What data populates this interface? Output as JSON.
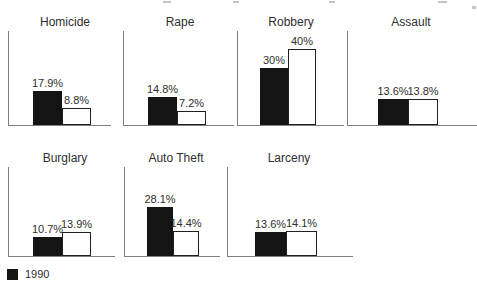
{
  "figure": {
    "legend": {
      "label": "1990",
      "swatch_color": "#141414"
    },
    "colors": {
      "bar_filled": "#141414",
      "bar_outline_border": "#1f1f1f",
      "axis": "#7e7e7e",
      "text": "#2f2f2f"
    }
  },
  "chart_data": {
    "type": "bar",
    "title": "",
    "categories": [
      "Homicide",
      "Rape",
      "Robbery",
      "Assault",
      "Burglary",
      "Auto Theft",
      "Larceny"
    ],
    "series": [
      {
        "name": "1990",
        "style": "filled-black",
        "values": [
          17.9,
          14.8,
          30,
          13.6,
          10.7,
          28.1,
          13.6
        ]
      },
      {
        "name": "",
        "style": "outlined-white",
        "values": [
          8.8,
          7.2,
          40,
          13.8,
          13.9,
          14.4,
          14.1
        ]
      }
    ],
    "value_labels": [
      [
        "17.9%",
        "8.8%"
      ],
      [
        "14.8%",
        "7.2%"
      ],
      [
        "30%",
        "40%"
      ],
      [
        "13.6%",
        "13.8%"
      ],
      [
        "10.7%",
        "13.9%"
      ],
      [
        "28.1%",
        "14.4%"
      ],
      [
        "13.6%",
        "14.1%"
      ]
    ],
    "legend": [
      {
        "label": "1990",
        "swatch": "filled-black"
      }
    ],
    "layout": {
      "unit": "percent",
      "grid": false,
      "legend_position": "bottom-left",
      "rows": [
        {
          "panel_idx": [
            0,
            1,
            2,
            3
          ],
          "title_y": 16,
          "axis_top_y": 31,
          "baseline_y": 125,
          "px_per_percent": 1.9
        },
        {
          "panel_idx": [
            4,
            5,
            6
          ],
          "title_y": 152,
          "axis_top_y": 167,
          "baseline_y": 256,
          "px_per_percent": 1.75
        }
      ],
      "panel_geometry": [
        {
          "axis_x": 8,
          "baseline_w": 103,
          "bar_offset": 25,
          "bar_w": 29
        },
        {
          "axis_x": 123,
          "baseline_w": 111,
          "bar_offset": 25,
          "bar_w": 29
        },
        {
          "axis_x": 237,
          "baseline_w": 107,
          "bar_offset": 23,
          "bar_w": 28
        },
        {
          "axis_x": 347,
          "baseline_w": 130,
          "bar_offset": 31,
          "bar_w": 30
        },
        {
          "axis_x": 8,
          "baseline_w": 107,
          "bar_offset": 25,
          "bar_w": 29
        },
        {
          "axis_x": 124,
          "baseline_w": 96,
          "bar_offset": 23,
          "bar_w": 26
        },
        {
          "axis_x": 227,
          "baseline_w": 126,
          "bar_offset": 28,
          "bar_w": 31
        }
      ]
    }
  }
}
